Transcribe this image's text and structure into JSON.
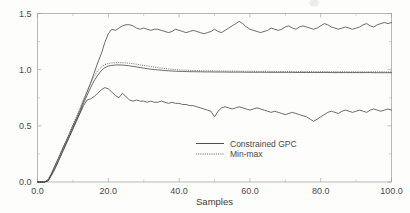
{
  "chart_data": {
    "type": "line",
    "title": "",
    "xlabel": "Samples",
    "ylabel": "",
    "xlim": [
      0,
      100
    ],
    "ylim": [
      0,
      1.5
    ],
    "grid": false,
    "legend_position": "inside-center-bottom",
    "xticks": [
      "0.0",
      "20.0",
      "40.0",
      "60.0",
      "80.0",
      "100.0"
    ],
    "xtick_values": [
      0,
      20,
      40,
      60,
      80,
      100
    ],
    "yticks": [
      "0.0",
      "0.5",
      "1.0",
      "1.5"
    ],
    "ytick_values": [
      0.0,
      0.5,
      1.0,
      1.5
    ],
    "minor_xtick_values": [
      10,
      30,
      50,
      70,
      90
    ],
    "minor_ytick_values": [
      0.25,
      0.75,
      1.25
    ],
    "legend": [
      {
        "label": "Constrained GPC",
        "style": "solid"
      },
      {
        "label": "Min-max",
        "style": "dotted"
      }
    ],
    "series": [
      {
        "name": "Constrained GPC upper bound",
        "style": "solid",
        "x": [
          0,
          1,
          2,
          3,
          4,
          5,
          6,
          7,
          8,
          9,
          10,
          11,
          12,
          13,
          14,
          15,
          16,
          17,
          18,
          19,
          20,
          21,
          22,
          23,
          24,
          25,
          26,
          27,
          28,
          29,
          30,
          31,
          32,
          33,
          34,
          35,
          36,
          37,
          38,
          39,
          40,
          41,
          42,
          43,
          44,
          45,
          46,
          47,
          48,
          49,
          50,
          51,
          52,
          53,
          54,
          55,
          56,
          57,
          58,
          59,
          60,
          61,
          62,
          63,
          64,
          65,
          66,
          67,
          68,
          69,
          70,
          71,
          72,
          73,
          74,
          75,
          76,
          77,
          78,
          79,
          80,
          81,
          82,
          83,
          84,
          85,
          86,
          87,
          88,
          89,
          90,
          91,
          92,
          93,
          94,
          95,
          96,
          97,
          98,
          99,
          100
        ],
        "values": [
          0.0,
          0.0,
          0.0,
          0.02,
          0.08,
          0.15,
          0.22,
          0.29,
          0.36,
          0.43,
          0.5,
          0.57,
          0.64,
          0.72,
          0.8,
          0.88,
          0.97,
          1.06,
          1.14,
          1.24,
          1.32,
          1.36,
          1.35,
          1.37,
          1.39,
          1.4,
          1.4,
          1.39,
          1.37,
          1.36,
          1.37,
          1.36,
          1.35,
          1.36,
          1.36,
          1.35,
          1.34,
          1.33,
          1.34,
          1.36,
          1.35,
          1.34,
          1.33,
          1.34,
          1.35,
          1.34,
          1.33,
          1.32,
          1.33,
          1.34,
          1.36,
          1.34,
          1.33,
          1.35,
          1.37,
          1.39,
          1.41,
          1.43,
          1.41,
          1.38,
          1.36,
          1.35,
          1.34,
          1.33,
          1.34,
          1.35,
          1.37,
          1.36,
          1.35,
          1.36,
          1.38,
          1.39,
          1.37,
          1.36,
          1.38,
          1.39,
          1.38,
          1.37,
          1.36,
          1.37,
          1.39,
          1.41,
          1.4,
          1.38,
          1.37,
          1.36,
          1.37,
          1.38,
          1.37,
          1.36,
          1.37,
          1.38,
          1.4,
          1.41,
          1.39,
          1.38,
          1.4,
          1.41,
          1.42,
          1.41,
          1.42
        ]
      },
      {
        "name": "Min-max bound",
        "style": "dotted",
        "x": [
          0,
          1,
          2,
          3,
          4,
          5,
          6,
          7,
          8,
          9,
          10,
          11,
          12,
          13,
          14,
          15,
          16,
          17,
          18,
          19,
          20,
          21,
          22,
          23,
          24,
          25,
          26,
          27,
          28,
          29,
          30,
          31,
          32,
          33,
          34,
          35,
          36,
          37,
          38,
          39,
          40,
          41,
          42,
          43,
          44,
          45,
          46,
          47,
          48,
          49,
          50,
          51,
          52,
          53,
          54,
          55,
          56,
          57,
          58,
          59,
          60,
          61,
          62,
          63,
          64,
          65,
          66,
          67,
          68,
          69,
          70,
          71,
          72,
          73,
          74,
          75,
          76,
          77,
          78,
          79,
          80,
          81,
          82,
          83,
          84,
          85,
          86,
          87,
          88,
          89,
          90,
          91,
          92,
          93,
          94,
          95,
          96,
          97,
          98,
          99,
          100
        ],
        "values": [
          0.0,
          0.0,
          0.0,
          0.02,
          0.08,
          0.15,
          0.22,
          0.29,
          0.36,
          0.43,
          0.51,
          0.58,
          0.66,
          0.74,
          0.81,
          0.88,
          0.94,
          0.99,
          1.02,
          1.045,
          1.055,
          1.06,
          1.062,
          1.063,
          1.062,
          1.06,
          1.057,
          1.053,
          1.048,
          1.043,
          1.038,
          1.033,
          1.028,
          1.023,
          1.018,
          1.014,
          1.01,
          1.006,
          1.003,
          1.0,
          0.998,
          0.996,
          0.995,
          0.994,
          0.993,
          0.992,
          0.991,
          0.99,
          0.99,
          0.989,
          0.989,
          0.988,
          0.988,
          0.988,
          0.987,
          0.987,
          0.987,
          0.986,
          0.986,
          0.986,
          0.986,
          0.985,
          0.985,
          0.985,
          0.985,
          0.985,
          0.984,
          0.984,
          0.984,
          0.984,
          0.984,
          0.984,
          0.983,
          0.983,
          0.983,
          0.983,
          0.983,
          0.983,
          0.983,
          0.982,
          0.982,
          0.982,
          0.982,
          0.982,
          0.982,
          0.982,
          0.982,
          0.982,
          0.981,
          0.981,
          0.981,
          0.981,
          0.981,
          0.981,
          0.981,
          0.981,
          0.981,
          0.981,
          0.981,
          0.98,
          0.98
        ]
      },
      {
        "name": "Constrained GPC mean",
        "style": "solid",
        "x": [
          0,
          1,
          2,
          3,
          4,
          5,
          6,
          7,
          8,
          9,
          10,
          11,
          12,
          13,
          14,
          15,
          16,
          17,
          18,
          19,
          20,
          21,
          22,
          23,
          24,
          25,
          26,
          27,
          28,
          29,
          30,
          31,
          32,
          33,
          34,
          35,
          36,
          37,
          38,
          39,
          40,
          41,
          42,
          43,
          44,
          45,
          46,
          47,
          48,
          49,
          50,
          51,
          52,
          53,
          54,
          55,
          56,
          57,
          58,
          59,
          60,
          61,
          62,
          63,
          64,
          65,
          66,
          67,
          68,
          69,
          70,
          71,
          72,
          73,
          74,
          75,
          76,
          77,
          78,
          79,
          80,
          81,
          82,
          83,
          84,
          85,
          86,
          87,
          88,
          89,
          90,
          91,
          92,
          93,
          94,
          95,
          96,
          97,
          98,
          99,
          100
        ],
        "values": [
          0.0,
          0.0,
          0.0,
          0.01,
          0.07,
          0.13,
          0.2,
          0.27,
          0.34,
          0.41,
          0.48,
          0.55,
          0.62,
          0.7,
          0.77,
          0.84,
          0.9,
          0.95,
          0.99,
          1.018,
          1.032,
          1.038,
          1.041,
          1.042,
          1.041,
          1.038,
          1.034,
          1.029,
          1.024,
          1.019,
          1.014,
          1.009,
          1.005,
          1.001,
          0.998,
          0.995,
          0.992,
          0.99,
          0.988,
          0.986,
          0.985,
          0.984,
          0.983,
          0.982,
          0.982,
          0.981,
          0.981,
          0.98,
          0.98,
          0.98,
          0.979,
          0.979,
          0.979,
          0.979,
          0.978,
          0.978,
          0.978,
          0.978,
          0.978,
          0.977,
          0.977,
          0.977,
          0.977,
          0.977,
          0.977,
          0.976,
          0.976,
          0.976,
          0.976,
          0.976,
          0.976,
          0.976,
          0.976,
          0.975,
          0.975,
          0.975,
          0.975,
          0.975,
          0.975,
          0.975,
          0.975,
          0.975,
          0.975,
          0.974,
          0.974,
          0.974,
          0.974,
          0.974,
          0.974,
          0.974,
          0.974,
          0.974,
          0.974,
          0.974,
          0.974,
          0.973,
          0.973,
          0.973,
          0.973,
          0.973,
          0.973
        ]
      },
      {
        "name": "Constrained GPC lower bound",
        "style": "solid",
        "x": [
          0,
          1,
          2,
          3,
          4,
          5,
          6,
          7,
          8,
          9,
          10,
          11,
          12,
          13,
          14,
          15,
          16,
          17,
          18,
          19,
          20,
          21,
          22,
          23,
          24,
          25,
          26,
          27,
          28,
          29,
          30,
          31,
          32,
          33,
          34,
          35,
          36,
          37,
          38,
          39,
          40,
          41,
          42,
          43,
          44,
          45,
          46,
          47,
          48,
          49,
          50,
          51,
          52,
          53,
          54,
          55,
          56,
          57,
          58,
          59,
          60,
          61,
          62,
          63,
          64,
          65,
          66,
          67,
          68,
          69,
          70,
          71,
          72,
          73,
          74,
          75,
          76,
          77,
          78,
          79,
          80,
          81,
          82,
          83,
          84,
          85,
          86,
          87,
          88,
          89,
          90,
          91,
          92,
          93,
          94,
          95,
          96,
          97,
          98,
          99,
          100
        ],
        "values": [
          0.0,
          0.0,
          0.0,
          0.01,
          0.06,
          0.12,
          0.19,
          0.26,
          0.33,
          0.4,
          0.47,
          0.54,
          0.61,
          0.68,
          0.73,
          0.74,
          0.76,
          0.79,
          0.82,
          0.84,
          0.83,
          0.8,
          0.77,
          0.75,
          0.79,
          0.76,
          0.73,
          0.72,
          0.73,
          0.72,
          0.72,
          0.71,
          0.72,
          0.71,
          0.71,
          0.72,
          0.71,
          0.7,
          0.71,
          0.7,
          0.7,
          0.69,
          0.69,
          0.68,
          0.68,
          0.67,
          0.66,
          0.65,
          0.64,
          0.63,
          0.58,
          0.63,
          0.66,
          0.67,
          0.66,
          0.65,
          0.66,
          0.67,
          0.66,
          0.65,
          0.64,
          0.65,
          0.66,
          0.65,
          0.64,
          0.63,
          0.62,
          0.63,
          0.62,
          0.61,
          0.6,
          0.61,
          0.62,
          0.61,
          0.6,
          0.59,
          0.58,
          0.56,
          0.54,
          0.56,
          0.58,
          0.6,
          0.62,
          0.63,
          0.62,
          0.61,
          0.63,
          0.64,
          0.63,
          0.62,
          0.63,
          0.64,
          0.63,
          0.62,
          0.64,
          0.65,
          0.64,
          0.63,
          0.64,
          0.65,
          0.64
        ]
      }
    ]
  }
}
